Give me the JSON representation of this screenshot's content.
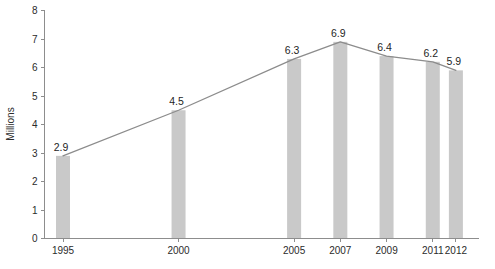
{
  "chart_data": {
    "type": "bar",
    "title": "",
    "subtitle": "",
    "xlabel": "",
    "ylabel": "Millions",
    "categories": [
      "1995",
      "2000",
      "2005",
      "2007",
      "2009",
      "2011",
      "2012"
    ],
    "values": [
      2.9,
      4.5,
      6.3,
      6.9,
      6.4,
      6.2,
      5.9
    ],
    "data_labels": [
      "2.9",
      "4.5",
      "6.3",
      "6.9",
      "6.4",
      "6.2",
      "5.9"
    ],
    "series": [
      {
        "name": "bars",
        "type": "bar",
        "values": [
          2.9,
          4.5,
          6.3,
          6.9,
          6.4,
          6.2,
          5.9
        ]
      },
      {
        "name": "trend-line",
        "type": "line",
        "values": [
          2.9,
          4.5,
          6.3,
          6.9,
          6.4,
          6.2,
          5.9
        ]
      }
    ],
    "ylim": [
      0,
      8
    ],
    "ytick_labels": [
      "0",
      "1",
      "2",
      "3",
      "4",
      "5",
      "6",
      "7",
      "8"
    ],
    "ytick_values": [
      0,
      1,
      2,
      3,
      4,
      5,
      6,
      7,
      8
    ],
    "xtick_labels": [
      "1995",
      "2000",
      "2005",
      "2007",
      "2009",
      "2011",
      "2012"
    ],
    "x_positions": [
      1995,
      2000,
      2005,
      2007,
      2009,
      2011,
      2012
    ],
    "xlim": [
      1994.2,
      2013.0
    ],
    "grid": false,
    "legend": "none",
    "colors": {
      "bar": "#c9c9c9",
      "line": "#8c8c8c",
      "axis": "#8d8d8d",
      "text": "#2b2b2b",
      "background": "#ffffff"
    }
  }
}
